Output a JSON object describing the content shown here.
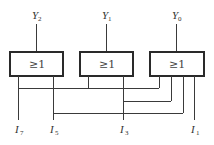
{
  "diagram": {
    "type": "logic-circuit",
    "gates": [
      {
        "id": "gate-y2",
        "symbol": "≥1",
        "output": {
          "letter": "Y",
          "sub": "2"
        },
        "inputs": [
          "I7",
          "I5"
        ]
      },
      {
        "id": "gate-y1",
        "symbol": "≥1",
        "output": {
          "letter": "Y",
          "sub": "1"
        },
        "inputs": [
          "I7",
          "I3"
        ]
      },
      {
        "id": "gate-y0",
        "symbol": "≥1",
        "output": {
          "letter": "Y",
          "sub": "0"
        },
        "inputs": [
          "I7",
          "I3",
          "I5",
          "I1"
        ]
      }
    ],
    "inputs": [
      {
        "letter": "I",
        "sub": "7"
      },
      {
        "letter": "I",
        "sub": "5"
      },
      {
        "letter": "I",
        "sub": "3"
      },
      {
        "letter": "I",
        "sub": "1"
      }
    ],
    "colors": {
      "line": "#3a3a3a",
      "background": "#ffffff"
    }
  }
}
